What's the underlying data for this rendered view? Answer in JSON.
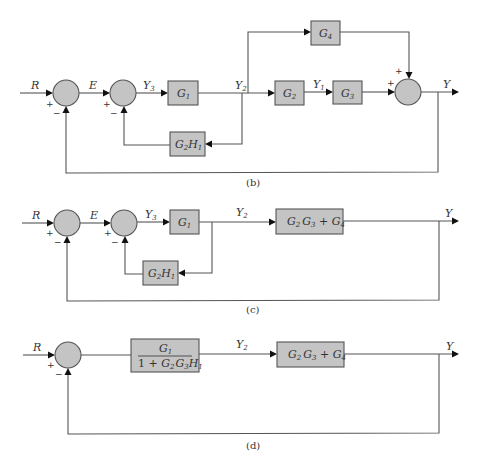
{
  "diagrams": {
    "b": {
      "caption": "(b)",
      "signals": {
        "R": "R",
        "E": "E",
        "Y3": "Y",
        "Y3_sub": "3",
        "Y2": "Y",
        "Y2_sub": "2",
        "Y1": "Y",
        "Y1_sub": "1",
        "Y": "Y"
      },
      "blocks": {
        "G1": {
          "main": "G",
          "sub": "1"
        },
        "G2": {
          "main": "G",
          "sub": "2"
        },
        "G3": {
          "main": "G",
          "sub": "3"
        },
        "G4": {
          "main": "G",
          "sub": "4"
        },
        "G2H1": {
          "a": "G",
          "a_sub": "2",
          "b": "H",
          "b_sub": "1"
        }
      },
      "signs": {
        "s1_plus": "+",
        "s1_minus": "−",
        "s2_plus": "+",
        "s2_minus": "−",
        "s3_plus_left": "+",
        "s3_plus_top": "+"
      }
    },
    "c": {
      "caption": "(c)",
      "signals": {
        "R": "R",
        "E": "E",
        "Y3": "Y",
        "Y3_sub": "3",
        "Y2": "Y",
        "Y2_sub": "2",
        "Y": "Y"
      },
      "blocks": {
        "G1": {
          "main": "G",
          "sub": "1"
        },
        "G2H1": {
          "a": "G",
          "a_sub": "2",
          "b": "H",
          "b_sub": "1"
        },
        "combined": {
          "text": "G2 G3 + G4",
          "a": "G",
          "a_sub": "2",
          "b": "G",
          "b_sub": "3",
          "op": " + ",
          "c": "G",
          "c_sub": "4"
        }
      },
      "signs": {
        "s1_plus": "+",
        "s1_minus": "−",
        "s2_plus": "+",
        "s2_minus": "−"
      }
    },
    "d": {
      "caption": "(d)",
      "signals": {
        "R": "R",
        "Y2": "Y",
        "Y2_sub": "2",
        "Y": "Y"
      },
      "blocks": {
        "fraction": {
          "num": "G",
          "num_sub": "1",
          "den_prefix": "1 + ",
          "den_a": "G",
          "den_a_sub": "2",
          "den_b": "G",
          "den_b_sub": "3",
          "den_c": "H",
          "den_c_sub": "1"
        },
        "combined": {
          "a": "G",
          "a_sub": "2",
          "b": "G",
          "b_sub": "3",
          "op": " + ",
          "c": "G",
          "c_sub": "4"
        }
      },
      "signs": {
        "s1_plus": "+",
        "s1_minus": "−"
      }
    }
  },
  "colors": {
    "block_fill": "#c4c4c4",
    "line": "#555555",
    "arrow": "#111111"
  }
}
